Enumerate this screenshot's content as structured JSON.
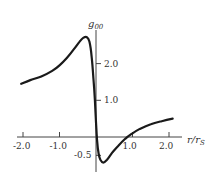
{
  "chart_data": {
    "type": "line",
    "title": "",
    "xlabel": "r/r_s",
    "ylabel": "g_00",
    "xlim": [
      -2.2,
      2.3
    ],
    "ylim": [
      -0.7,
      2.9
    ],
    "grid": false,
    "legend": null,
    "x_ticks": [
      -2.0,
      -1.0,
      1.0,
      2.0
    ],
    "x_tick_labels": [
      "-2.0",
      "-1.0",
      "1.0",
      "2.0"
    ],
    "y_ticks": [
      2.0,
      1.0,
      -0.5
    ],
    "y_tick_labels": [
      "2.0",
      "1.0",
      "-0.5"
    ],
    "series": [
      {
        "name": "g00",
        "color": "#1a1a1a",
        "x": [
          -2.05,
          -1.8,
          -1.5,
          -1.2,
          -1.0,
          -0.8,
          -0.6,
          -0.45,
          -0.35,
          -0.25,
          -0.18,
          -0.12,
          -0.07,
          -0.03,
          0.0,
          0.03,
          0.07,
          0.12,
          0.2,
          0.3,
          0.45,
          0.6,
          0.8,
          1.0,
          1.2,
          1.5,
          1.8,
          2.1
        ],
        "y": [
          1.45,
          1.55,
          1.65,
          1.8,
          1.95,
          2.15,
          2.4,
          2.6,
          2.7,
          2.72,
          2.6,
          2.2,
          1.6,
          1.0,
          0.4,
          -0.1,
          -0.45,
          -0.62,
          -0.7,
          -0.62,
          -0.42,
          -0.25,
          -0.05,
          0.1,
          0.22,
          0.35,
          0.43,
          0.5
        ]
      }
    ]
  },
  "labels": {
    "ylabel_main": "g",
    "ylabel_sub": "00",
    "xlabel_main": "r/r",
    "xlabel_sub": "S"
  }
}
